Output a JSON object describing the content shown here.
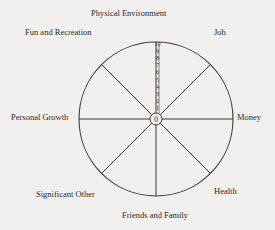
{
  "diagram": {
    "type": "wheel-of-life",
    "center": {
      "x": 156,
      "y": 119
    },
    "radius": 77,
    "inner_radius": 6,
    "center_label": "0",
    "scale_ticks": [
      "1",
      "2",
      "3",
      "4",
      "5",
      "6",
      "7",
      "8",
      "9",
      "10"
    ],
    "spoke_angles_deg": [
      0,
      45,
      90,
      135,
      180,
      225,
      270,
      315
    ],
    "colors": {
      "background": "#f1f0ee",
      "line": "#3a3a3a",
      "text": "#2a2a2a"
    },
    "segments": [
      {
        "label": "Physical Environment",
        "x": 91,
        "y": 8
      },
      {
        "label": "Job",
        "x": 214,
        "y": 27
      },
      {
        "label": "Money",
        "x": 237,
        "y": 112
      },
      {
        "label": "Health",
        "x": 214,
        "y": 186
      },
      {
        "label": "Friends and Family",
        "x": 122,
        "y": 210
      },
      {
        "label": "Significant Other",
        "x": 36,
        "y": 189
      },
      {
        "label": "Personal Growth",
        "x": 11,
        "y": 112
      },
      {
        "label": "Fun and Recreation",
        "x": 25,
        "y": 27
      }
    ]
  }
}
